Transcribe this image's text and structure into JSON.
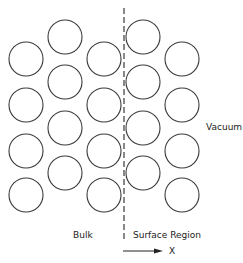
{
  "diagram": {
    "labels": {
      "bulk": "Bulk",
      "surface": "Surface Region",
      "vacuum": "Vacuum",
      "axis": "X"
    },
    "atom_radius": 17,
    "atoms": [
      {
        "x": 26,
        "y": 59
      },
      {
        "x": 26,
        "y": 105
      },
      {
        "x": 26,
        "y": 151
      },
      {
        "x": 26,
        "y": 195
      },
      {
        "x": 65,
        "y": 37
      },
      {
        "x": 65,
        "y": 82
      },
      {
        "x": 65,
        "y": 128
      },
      {
        "x": 65,
        "y": 173
      },
      {
        "x": 104,
        "y": 59
      },
      {
        "x": 104,
        "y": 105
      },
      {
        "x": 104,
        "y": 151
      },
      {
        "x": 104,
        "y": 195
      },
      {
        "x": 143,
        "y": 37
      },
      {
        "x": 143,
        "y": 82
      },
      {
        "x": 143,
        "y": 128
      },
      {
        "x": 143,
        "y": 173
      },
      {
        "x": 182,
        "y": 59
      },
      {
        "x": 182,
        "y": 105
      },
      {
        "x": 182,
        "y": 151
      },
      {
        "x": 182,
        "y": 195
      }
    ],
    "boundary": {
      "x": 124,
      "y1": 8,
      "y2": 241
    },
    "arrow": {
      "x1": 123,
      "x2": 163,
      "y": 251
    },
    "colors": {
      "stroke": "#3a3a3a",
      "text": "#222222"
    }
  }
}
